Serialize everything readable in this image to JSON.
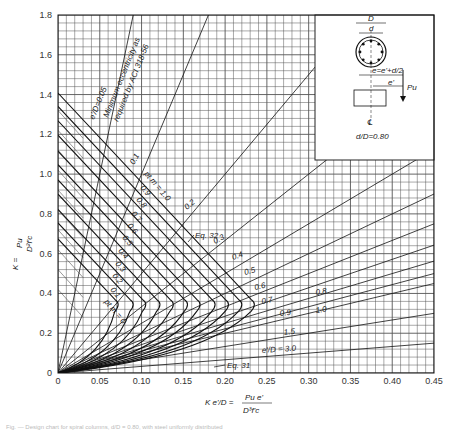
{
  "chart_data": {
    "type": "line",
    "xlabel": "K e'/D = Pu e' / (D^3 f'c)",
    "ylabel": "K = Pu / (D^2 f'c)",
    "xlim": [
      0,
      0.45
    ],
    "ylim": [
      0,
      1.8
    ],
    "grid": true,
    "x_ticks": [
      "0",
      "0.05",
      "0.10",
      "0.15",
      "0.20",
      "0.25",
      "0.30",
      "0.35",
      "0.40",
      "0.45"
    ],
    "y_ticks": [
      "0",
      "0.2",
      "0.4",
      "0.6",
      "0.8",
      "1.0",
      "1.2",
      "1.4",
      "1.6",
      "1.8"
    ],
    "inset": {
      "ratio_label": "d/D = 0.80",
      "labels": [
        "D",
        "d",
        "e = e' + d/2",
        "e'",
        "Pu",
        "CL"
      ]
    },
    "eccentricity_lines": [
      {
        "label": "e'/D = 0.05",
        "slope": 0.05
      },
      {
        "label": "0.1",
        "slope": 0.1
      },
      {
        "label": "0.2",
        "slope": 0.2
      },
      {
        "label": "0.3",
        "slope": 0.3
      },
      {
        "label": "0.4",
        "slope": 0.4
      },
      {
        "label": "0.5",
        "slope": 0.5
      },
      {
        "label": "0.6",
        "slope": 0.6
      },
      {
        "label": "0.7",
        "slope": 0.7
      },
      {
        "label": "0.8",
        "slope": 0.8
      },
      {
        "label": "0.9",
        "slope": 0.9
      },
      {
        "label": "1.0",
        "slope": 1.0
      },
      {
        "label": "1.5",
        "slope": 1.5
      },
      {
        "label": "e'/D = 3.0",
        "slope": 3.0
      }
    ],
    "pm_curves": [
      {
        "label": "pt m = 0",
        "k0": 0.85,
        "x_bal": 0.072,
        "y_bal": 0.35
      },
      {
        "label": "0.1",
        "k0": 0.94,
        "x_bal": 0.09,
        "y_bal": 0.35
      },
      {
        "label": "0.2",
        "k0": 1.02,
        "x_bal": 0.105,
        "y_bal": 0.35
      },
      {
        "label": "0.3",
        "k0": 1.11,
        "x_bal": 0.122,
        "y_bal": 0.35
      },
      {
        "label": "0.4",
        "k0": 1.19,
        "x_bal": 0.138,
        "y_bal": 0.35
      },
      {
        "label": "0.5",
        "k0": 1.28,
        "x_bal": 0.155,
        "y_bal": 0.35
      },
      {
        "label": "0.6",
        "k0": 1.36,
        "x_bal": 0.17,
        "y_bal": 0.35
      },
      {
        "label": "0.7",
        "k0": 1.45,
        "x_bal": 0.188,
        "y_bal": 0.35
      },
      {
        "label": "0.8",
        "k0": 1.53,
        "x_bal": 0.204,
        "y_bal": 0.35
      },
      {
        "label": "0.9",
        "k0": 1.62,
        "x_bal": 0.22,
        "y_bal": 0.35
      },
      {
        "label": "pt m = 1.0",
        "k0": 1.7,
        "x_bal": 0.235,
        "y_bal": 0.35
      }
    ],
    "annotations": [
      "Minimum eccentricity as required by ACI 318-56",
      "Eq. 32",
      "Eq. 31"
    ]
  },
  "axes": {
    "y_label_top": "Pu",
    "y_label_bottom": "D²f'c",
    "y_label_k": "K =",
    "x_label_lhs": "K e'/D =",
    "x_label_num": "Pu e'",
    "x_label_den": "D³f'c"
  },
  "labels": {
    "min_ecc_1": "e'/D=0.05",
    "min_ecc_2": "Minimum eccentricity as",
    "min_ecc_3": "required by ACI 318-56",
    "eq32": "Eq. 32",
    "eq31": "Eq. 31",
    "d_over_D": "d/D=0.80",
    "inset_D": "D",
    "inset_d": "d",
    "inset_e": "e=e'+d/2",
    "inset_eprime": "e'",
    "inset_pu": "Pu",
    "inset_cl": "℄"
  },
  "caption": "Fig. — Design chart for spiral columns, d/D = 0.80, with steel uniformly distributed"
}
